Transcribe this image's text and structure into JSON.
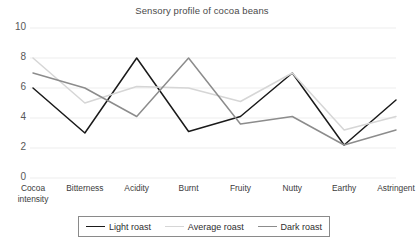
{
  "chart_data": {
    "type": "line",
    "title": "Sensory profile of cocoa beans",
    "xlabel": "",
    "ylabel": "",
    "ylim": [
      0,
      10
    ],
    "yticks": [
      0,
      2,
      4,
      6,
      8,
      10
    ],
    "grid": true,
    "legend_position": "bottom",
    "categories": [
      "Cocoa intensity",
      "Bitterness",
      "Acidity",
      "Burnt",
      "Fruity",
      "Nutty",
      "Earthy",
      "Astringent"
    ],
    "series": [
      {
        "name": "Light roast",
        "color": "#1a1a1a",
        "values": [
          6.0,
          3.0,
          8.0,
          3.1,
          4.1,
          7.0,
          2.2,
          5.2
        ]
      },
      {
        "name": "Average roast",
        "color": "#d6d6d6",
        "values": [
          8.0,
          5.0,
          6.1,
          6.0,
          5.1,
          7.0,
          3.2,
          4.1
        ]
      },
      {
        "name": "Dark roast",
        "color": "#8c8c8c",
        "values": [
          7.0,
          6.0,
          4.1,
          8.0,
          3.6,
          4.1,
          2.2,
          3.2
        ]
      }
    ]
  },
  "axis": {
    "y_tick_labels": [
      "10",
      "8",
      "6",
      "4",
      "2",
      "0"
    ],
    "x_tick_labels": [
      [
        "Cocoa",
        "intensity"
      ],
      [
        "Bitterness"
      ],
      [
        "Acidity"
      ],
      [
        "Burnt"
      ],
      [
        "Fruity"
      ],
      [
        "Nutty"
      ],
      [
        "Earthy"
      ],
      [
        "Astringent"
      ]
    ]
  },
  "legend": {
    "items": [
      {
        "label": "Light roast",
        "color": "#1a1a1a"
      },
      {
        "label": "Average roast",
        "color": "#d6d6d6"
      },
      {
        "label": "Dark roast",
        "color": "#8c8c8c"
      }
    ]
  },
  "style": {
    "gridline_color": "#ededed",
    "background": "#ffffff"
  }
}
